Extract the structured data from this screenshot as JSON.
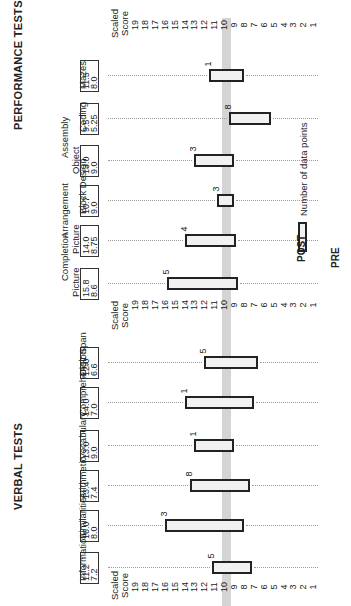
{
  "chart_data": {
    "type": "bar",
    "subtype": "floating-range (pre to post)",
    "orientation": "rotated 90 degrees; score axis horizontal, 19 at left, 1 at right",
    "axis": {
      "title": "Scaled Score",
      "ticks": [
        19,
        18,
        17,
        16,
        15,
        14,
        13,
        12,
        11,
        10,
        9,
        8,
        7,
        6,
        5,
        4,
        3,
        2,
        1
      ],
      "range": [
        1,
        19
      ],
      "reference_line": 10
    },
    "groups": [
      {
        "title": "VERBAL TESTS",
        "tests": [
          {
            "name": "Information",
            "post": 11.2,
            "pre": 7.2,
            "n": 5
          },
          {
            "name": "Similarities",
            "post": 16.0,
            "pre": 8.0,
            "n": 3
          },
          {
            "name": "Arithmetic",
            "post": 13.4,
            "pre": 7.4,
            "n": 8
          },
          {
            "name": "Vocabulary",
            "post": 13.0,
            "pre": 9.0,
            "n": 1
          },
          {
            "name": "Comprehension",
            "post": 14.0,
            "pre": 7.0,
            "n": 1
          },
          {
            "name": "Digit Span",
            "post": 12.0,
            "pre": 6.6,
            "n": 5
          }
        ]
      },
      {
        "title": "PERFORMANCE TESTS",
        "tests": [
          {
            "name": "Picture Completion",
            "post": 15.8,
            "pre": 8.6,
            "n": 5
          },
          {
            "name": "Picture Arrangement",
            "post": 14.0,
            "pre": 8.75,
            "n": 4
          },
          {
            "name": "Block Design",
            "post": 10.7,
            "pre": 9.0,
            "n": 3
          },
          {
            "name": "Object Assembly",
            "post": 13.0,
            "pre": 9.0,
            "n": 3
          },
          {
            "name": "Coding",
            "post": 9.5,
            "pre": 5.25,
            "n": 8
          },
          {
            "name": "Mazes",
            "post": 11.5,
            "pre": 8.0,
            "n": 1
          }
        ]
      }
    ],
    "legend": {
      "post_label": "POST",
      "pre_label": "PRE",
      "count_label": "Number of data points"
    }
  },
  "labels": {
    "verbal_title": "VERBAL TESTS",
    "performance_title": "PERFORMANCE TESTS",
    "axis_title_line1": "Scaled",
    "axis_title_line2": "Score",
    "legend_post": "POST",
    "legend_pre": "PRE",
    "legend_count": "Number of data points",
    "tests": {
      "information": {
        "line1": "Information",
        "line2": "",
        "post": "11.2",
        "pre": "7.2",
        "n": "5"
      },
      "similarities": {
        "line1": "Similarities",
        "line2": "",
        "post": "16.0",
        "pre": "8.0",
        "n": "3"
      },
      "arithmetic": {
        "line1": "Arithmetic",
        "line2": "",
        "post": "13.4",
        "pre": "7.4",
        "n": "8"
      },
      "vocabulary": {
        "line1": "Vocabulary",
        "line2": "",
        "post": "13.0",
        "pre": "9.0",
        "n": "1"
      },
      "comprehension": {
        "line1": "Comprehension",
        "line2": "",
        "post": "14.0",
        "pre": "7.0",
        "n": "1"
      },
      "digit_span": {
        "line1": "Digit Span",
        "line2": "",
        "post": "12.0",
        "pre": "6.6",
        "n": "5"
      },
      "picture_completion": {
        "line1": "Picture",
        "line2": "Completion",
        "post": "15.8",
        "pre": "8.6",
        "n": "5"
      },
      "picture_arrangement": {
        "line1": "Picture",
        "line2": "Arrangement",
        "post": "14.0",
        "pre": "8.75",
        "n": "4"
      },
      "block_design": {
        "line1": "Block Design",
        "line2": "",
        "post": "10.7",
        "pre": "9.0",
        "n": "3"
      },
      "object_assembly": {
        "line1": "Object",
        "line2": "Assembly",
        "post": "13.0",
        "pre": "9.0",
        "n": "3"
      },
      "coding": {
        "line1": "Coding",
        "line2": "",
        "post": "9.5",
        "pre": "5.25",
        "n": "8"
      },
      "mazes": {
        "line1": "Mazes",
        "line2": "",
        "post": "11.5",
        "pre": "8.0",
        "n": "1"
      }
    },
    "ticks": [
      "19",
      "18",
      "17",
      "16",
      "15",
      "14",
      "13",
      "12",
      "11",
      "10",
      "9",
      "8",
      "7",
      "6",
      "5",
      "4",
      "3",
      "2",
      "1"
    ]
  }
}
